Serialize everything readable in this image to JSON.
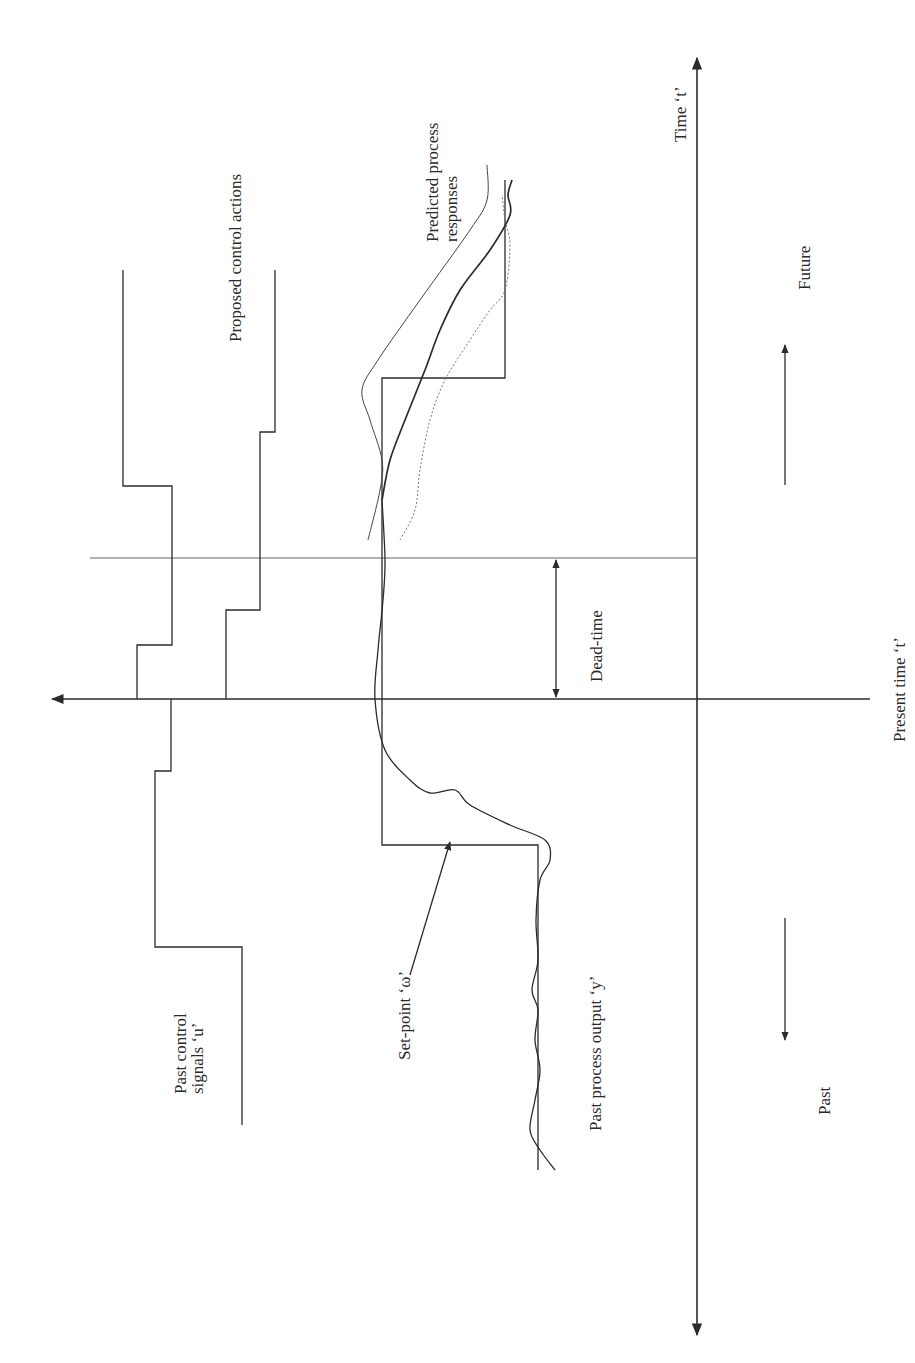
{
  "figure": {
    "type": "mpc-receding-horizon",
    "orientation": "rotated 90° counter-clockwise (time runs upward)",
    "labels": {
      "proposed_control_actions": "Proposed control actions",
      "predicted_process_responses_1": "Predicted process",
      "predicted_process_responses_2": "responses",
      "time": "Time ‘t’",
      "future": "Future",
      "dead_time": "Dead-time",
      "present_time": "Present time ‘t’",
      "past_control_signals_1": "Past control",
      "past_control_signals_2": "signals ‘u’",
      "set_point": "Set-point ‘ω’",
      "past_process_output": "Past process output ‘y’",
      "past": "Past"
    },
    "colors": {
      "ink": "#2b2b2b",
      "background": "#ffffff",
      "dotted_response": "#777777"
    },
    "geometry": {
      "time_axis_x": 697,
      "time_axis_top": 58,
      "time_axis_bottom": 1335,
      "present_line_y": 699,
      "present_line_x1": 52,
      "present_line_x2": 870,
      "dead_time_line_y": 558,
      "dead_time_line_x1": 90,
      "dead_time_line_x2": 697,
      "dead_time_arrow_x": 556
    },
    "series": {
      "past_control_u": [
        [
          242,
          1125
        ],
        [
          242,
          947
        ],
        [
          155,
          947
        ],
        [
          155,
          771
        ],
        [
          171,
          771
        ],
        [
          171,
          699
        ]
      ],
      "proposed_control_1": [
        [
          137,
          699
        ],
        [
          137,
          645
        ],
        [
          172,
          645
        ],
        [
          172,
          486
        ],
        [
          123,
          486
        ],
        [
          123,
          270
        ]
      ],
      "proposed_control_2": [
        [
          226,
          699
        ],
        [
          226,
          610
        ],
        [
          260,
          610
        ],
        [
          260,
          432
        ],
        [
          275,
          432
        ],
        [
          275,
          270
        ]
      ],
      "set_point_w": [
        [
          538,
          1170
        ],
        [
          538,
          845
        ],
        [
          382,
          845
        ],
        [
          382,
          378
        ],
        [
          505,
          378
        ],
        [
          505,
          180
        ]
      ],
      "past_output_y": [
        [
          555,
          1170
        ],
        [
          540,
          1150
        ],
        [
          530,
          1130
        ],
        [
          535,
          1100
        ],
        [
          540,
          1070
        ],
        [
          535,
          1040
        ],
        [
          538,
          1010
        ],
        [
          532,
          990
        ],
        [
          538,
          960
        ],
        [
          536,
          920
        ],
        [
          540,
          880
        ],
        [
          550,
          860
        ],
        [
          545,
          840
        ],
        [
          510,
          825
        ],
        [
          470,
          805
        ],
        [
          455,
          790
        ],
        [
          430,
          793
        ],
        [
          410,
          780
        ],
        [
          385,
          750
        ],
        [
          375,
          699
        ],
        [
          378,
          650
        ],
        [
          383,
          600
        ],
        [
          385,
          560
        ],
        [
          382,
          500
        ]
      ],
      "predicted_response_thin": [
        [
          368,
          540
        ],
        [
          380,
          490
        ],
        [
          382,
          460
        ],
        [
          370,
          420
        ],
        [
          362,
          390
        ],
        [
          378,
          360
        ],
        [
          420,
          300
        ],
        [
          470,
          230
        ],
        [
          487,
          200
        ],
        [
          487,
          165
        ]
      ],
      "predicted_response_bold": [
        [
          382,
          500
        ],
        [
          390,
          460
        ],
        [
          405,
          420
        ],
        [
          425,
          370
        ],
        [
          440,
          330
        ],
        [
          460,
          290
        ],
        [
          490,
          250
        ],
        [
          510,
          215
        ],
        [
          508,
          195
        ],
        [
          512,
          180
        ]
      ],
      "predicted_response_dotted": [
        [
          400,
          540
        ],
        [
          415,
          510
        ],
        [
          420,
          470
        ],
        [
          430,
          420
        ],
        [
          445,
          380
        ],
        [
          470,
          340
        ],
        [
          490,
          310
        ],
        [
          505,
          290
        ],
        [
          510,
          245
        ],
        [
          505,
          220
        ],
        [
          502,
          195
        ]
      ]
    },
    "direction_arrows": {
      "future_arrow": {
        "x": 785,
        "y1": 485,
        "y2": 345
      },
      "past_arrow": {
        "x": 785,
        "y1": 918,
        "y2": 1040
      }
    },
    "setpoint_pointer": {
      "x1": 410,
      "y1": 975,
      "x2": 450,
      "y2": 842
    }
  }
}
